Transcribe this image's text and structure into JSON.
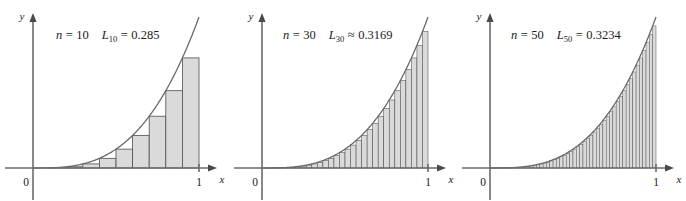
{
  "figure": {
    "background_color": "#ffffff",
    "panel_count": 3
  },
  "style": {
    "bar_fill": "#dadada",
    "bar_stroke": "#4e4e4e",
    "axis_color": "#6b6b6b",
    "curve_color": "#6a6a6a",
    "text_color": "#1a1a1a"
  },
  "axes": {
    "x_label": "x",
    "y_label": "y",
    "origin_label": "0",
    "x_tick_label": "1"
  },
  "panels": [
    {
      "id": "panel-n10",
      "n_prefix": "n",
      "n_equals": "=",
      "n_value": "10",
      "sum_symbol": "L",
      "sum_subscript": "10",
      "relation": "=",
      "sum_value": "0.285",
      "annotation": "n = 10   L₁₀ = 0.285",
      "bar_count": 10
    },
    {
      "id": "panel-n30",
      "n_prefix": "n",
      "n_equals": "=",
      "n_value": "30",
      "sum_symbol": "L",
      "sum_subscript": "30",
      "relation": "≈",
      "sum_value": "0.3169",
      "annotation": "n = 30   L₃₀ ≈ 0.3169",
      "bar_count": 30
    },
    {
      "id": "panel-n50",
      "n_prefix": "n",
      "n_equals": "=",
      "n_value": "50",
      "sum_symbol": "L",
      "sum_subscript": "50",
      "relation": "=",
      "sum_value": "0.3234",
      "annotation": "n = 50   L₅₀ = 0.3234",
      "bar_count": 50
    }
  ],
  "chart_data": {
    "type": "area",
    "xlabel": "x",
    "ylabel": "y",
    "xlim": [
      0,
      1
    ],
    "ylim": [
      0,
      1
    ],
    "grid": false,
    "legend": "none",
    "function": "y = x^3",
    "exact_area": 0.25,
    "series": [
      {
        "name": "L10",
        "n": 10,
        "relation": "=",
        "approximation": 0.285,
        "annotation": "n = 10   L₁₀ = 0.285",
        "left_endpoints": [
          0,
          0.1,
          0.2,
          0.3,
          0.4,
          0.5,
          0.6,
          0.7,
          0.8,
          0.9
        ],
        "bar_heights": [
          0,
          0.001,
          0.008,
          0.027,
          0.064,
          0.125,
          0.216,
          0.343,
          0.512,
          0.729
        ],
        "bar_width": 0.1
      },
      {
        "name": "L30",
        "n": 30,
        "relation": "≈",
        "approximation": 0.3169,
        "annotation": "n = 30   L₃₀ ≈ 0.3169",
        "bar_width": 0.03333
      },
      {
        "name": "L50",
        "n": 50,
        "relation": "=",
        "approximation": 0.3234,
        "annotation": "n = 50   L₅₀ = 0.3234",
        "bar_width": 0.02
      }
    ]
  }
}
